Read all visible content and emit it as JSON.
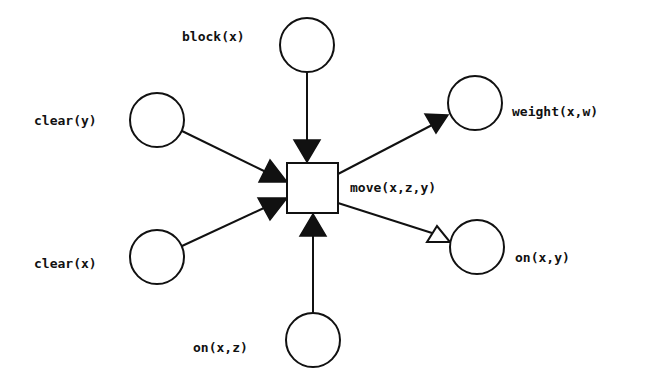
{
  "diagram": {
    "type": "petri-net",
    "colors": {
      "stroke": "#111111",
      "fill": "#ffffff",
      "arrow_filled": "#111111",
      "arrow_hollow": "#ffffff"
    },
    "transition": {
      "id": "move",
      "label": "move(x,z,y)",
      "x": 287,
      "y": 163,
      "w": 51,
      "h": 50
    },
    "places": [
      {
        "id": "block_x",
        "label": "block(x)",
        "cx": 307,
        "cy": 45,
        "r": 27,
        "role": "input"
      },
      {
        "id": "clear_y",
        "label": "clear(y)",
        "cx": 157,
        "cy": 120,
        "r": 27,
        "role": "input"
      },
      {
        "id": "clear_x",
        "label": "clear(x)",
        "cx": 157,
        "cy": 257,
        "r": 27,
        "role": "input"
      },
      {
        "id": "on_x_z",
        "label": "on(x,z)",
        "cx": 313,
        "cy": 340,
        "r": 27,
        "role": "input"
      },
      {
        "id": "weight_xw",
        "label": "weight(x,w)",
        "cx": 475,
        "cy": 103,
        "r": 27,
        "role": "output"
      },
      {
        "id": "on_x_y",
        "label": "on(x,y)",
        "cx": 477,
        "cy": 247,
        "r": 27,
        "role": "output"
      }
    ],
    "arcs": [
      {
        "from": "block_x",
        "to": "move",
        "head": "filled"
      },
      {
        "from": "clear_y",
        "to": "move",
        "head": "filled"
      },
      {
        "from": "clear_x",
        "to": "move",
        "head": "filled"
      },
      {
        "from": "on_x_z",
        "to": "move",
        "head": "filled"
      },
      {
        "from": "move",
        "to": "weight_xw",
        "head": "filled"
      },
      {
        "from": "move",
        "to": "on_x_y",
        "head": "hollow"
      }
    ]
  },
  "labels": {
    "block_x": "block(x)",
    "clear_y": "clear(y)",
    "clear_x": "clear(x)",
    "on_x_z": "on(x,z)",
    "weight_xw": "weight(x,w)",
    "on_x_y": "on(x,y)",
    "move": "move(x,z,y)"
  }
}
